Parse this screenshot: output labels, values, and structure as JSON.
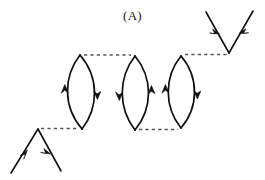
{
  "figure": {
    "panel_label": "(A)",
    "caption": "",
    "background_color": "#ffffff",
    "line_color": "#111111",
    "dashed_line_color": "#555555",
    "width": 265,
    "height": 180
  },
  "diagram": {
    "type": "feynman-diagram",
    "loops": [
      {
        "id": "loop-1",
        "top": {
          "x": 80,
          "y": 55
        },
        "bottom": {
          "x": 82,
          "y": 129
        },
        "bulge": 19,
        "left_arc_arrow": "up",
        "right_arc_arrow": "down",
        "arrow_y": 92
      },
      {
        "id": "loop-2",
        "top": {
          "x": 135,
          "y": 56
        },
        "bottom": {
          "x": 135,
          "y": 130
        },
        "bulge": 19,
        "left_arc_arrow": "down",
        "right_arc_arrow": "up",
        "arrow_y": 93
      },
      {
        "id": "loop-3",
        "top": {
          "x": 181,
          "y": 56
        },
        "bottom": {
          "x": 181,
          "y": 128
        },
        "bulge": 19,
        "left_arc_arrow": "up",
        "right_arc_arrow": "down",
        "arrow_y": 92
      }
    ],
    "external_vertices": [
      {
        "id": "left-vertex",
        "shape": "peak",
        "apex": {
          "x": 38,
          "y": 129
        },
        "leg_in_end": {
          "x": 11,
          "y": 173
        },
        "leg_out_end": {
          "x": 61,
          "y": 171
        },
        "leg_in_arrow": "toward-apex",
        "leg_out_arrow": "away-from-apex"
      },
      {
        "id": "right-vertex",
        "shape": "valley",
        "apex": {
          "x": 229,
          "y": 53
        },
        "leg_in_end": {
          "x": 206,
          "y": 12
        },
        "leg_out_end": {
          "x": 253,
          "y": 11
        },
        "leg_in_arrow": "toward-apex",
        "leg_out_arrow": "toward-apex"
      }
    ],
    "interaction_lines": [
      {
        "id": "dash-left-to-loop1",
        "from": {
          "x": 41,
          "y": 128
        },
        "to": {
          "x": 78,
          "y": 128
        }
      },
      {
        "id": "dash-loop1-to-loop2",
        "from": {
          "x": 84,
          "y": 55
        },
        "to": {
          "x": 131,
          "y": 55
        }
      },
      {
        "id": "dash-loop2-to-loop3",
        "from": {
          "x": 139,
          "y": 130
        },
        "to": {
          "x": 178,
          "y": 129
        }
      },
      {
        "id": "dash-loop3-to-right",
        "from": {
          "x": 185,
          "y": 55
        },
        "to": {
          "x": 227,
          "y": 54
        }
      }
    ]
  }
}
